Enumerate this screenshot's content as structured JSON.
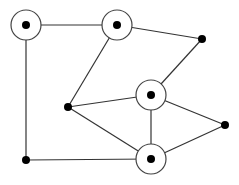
{
  "diagram": {
    "type": "undirected-graph",
    "stroke_color": "#333333",
    "node_fill": "#000000",
    "ring_color": "#444444",
    "nodes": [
      {
        "id": "A",
        "x": 26,
        "y": 25,
        "ringed": true
      },
      {
        "id": "B",
        "x": 117,
        "y": 25,
        "ringed": true
      },
      {
        "id": "C",
        "x": 202,
        "y": 39,
        "ringed": false
      },
      {
        "id": "D",
        "x": 151,
        "y": 95,
        "ringed": true
      },
      {
        "id": "E",
        "x": 68,
        "y": 107,
        "ringed": false
      },
      {
        "id": "F",
        "x": 225,
        "y": 125,
        "ringed": false
      },
      {
        "id": "G",
        "x": 151,
        "y": 159,
        "ringed": true
      },
      {
        "id": "H",
        "x": 26,
        "y": 160,
        "ringed": false
      }
    ],
    "edges": [
      [
        "A",
        "B"
      ],
      [
        "A",
        "H"
      ],
      [
        "B",
        "C"
      ],
      [
        "B",
        "E"
      ],
      [
        "C",
        "D"
      ],
      [
        "D",
        "E"
      ],
      [
        "D",
        "F"
      ],
      [
        "D",
        "G"
      ],
      [
        "E",
        "G"
      ],
      [
        "G",
        "F"
      ],
      [
        "H",
        "G"
      ]
    ]
  }
}
